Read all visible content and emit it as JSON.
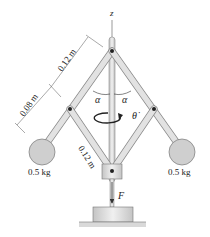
{
  "diagram": {
    "type": "mechanism",
    "axis_label": "z",
    "dimensions": {
      "upper_arm": "0.12 m",
      "extension": "0.08 m",
      "lower_link": "0.12 m"
    },
    "angles": {
      "left": "α",
      "right": "α"
    },
    "rotation_label": "θ̇",
    "masses": {
      "left": "0.5 kg",
      "right": "0.5 kg"
    },
    "force_label": "F",
    "colors": {
      "rod_fill": "#dcdcdc",
      "rod_stroke": "#8a8a8a",
      "ball_fill": "#cfcfcf",
      "ground": "#d9d9d9",
      "line": "#333333"
    }
  }
}
